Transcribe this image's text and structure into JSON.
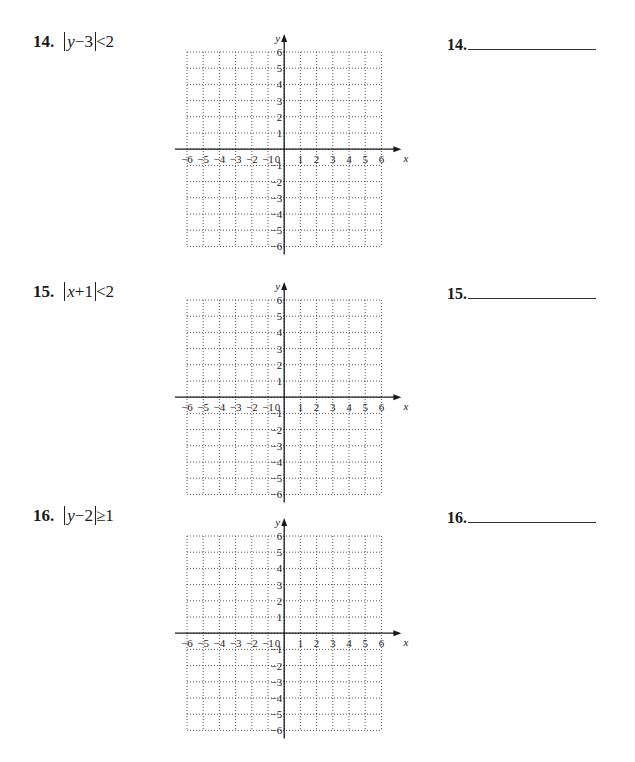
{
  "problems": [
    {
      "number": "14.",
      "expression_parts": {
        "open": "",
        "var": "y",
        "op": "−",
        "const": "3",
        "relation": "<",
        "rhs": "2"
      },
      "expression_text": "|y−3|<2",
      "answer_label": "14.",
      "answer_value": ""
    },
    {
      "number": "15.",
      "expression_parts": {
        "var": "x",
        "op": "+",
        "const": "1",
        "relation": "<",
        "rhs": "2"
      },
      "expression_text": "|x+1|<2",
      "answer_label": "15.",
      "answer_value": ""
    },
    {
      "number": "16.",
      "expression_parts": {
        "var": "y",
        "op": "−",
        "const": "2",
        "relation": "≥",
        "rhs": "1"
      },
      "expression_text": "|y−2|≥1",
      "answer_label": "16.",
      "answer_value": ""
    }
  ],
  "graph": {
    "x_axis_label": "x",
    "y_axis_label": "y",
    "x_ticks": [
      "−6",
      "−5",
      "−4",
      "−3",
      "−2",
      "−1",
      "0",
      "1",
      "2",
      "3",
      "4",
      "5",
      "6"
    ],
    "y_ticks_pos": [
      "6",
      "5",
      "4",
      "3",
      "2",
      "1"
    ],
    "y_ticks_neg": [
      "−1",
      "−2",
      "−3",
      "−4",
      "−5",
      "−6"
    ],
    "range": {
      "xmin": -6,
      "xmax": 6,
      "ymin": -6,
      "ymax": 6
    },
    "grid": "dotted"
  },
  "colors": {
    "ink": "#1a1a1a",
    "grid": "#555555",
    "paper": "#ffffff"
  }
}
